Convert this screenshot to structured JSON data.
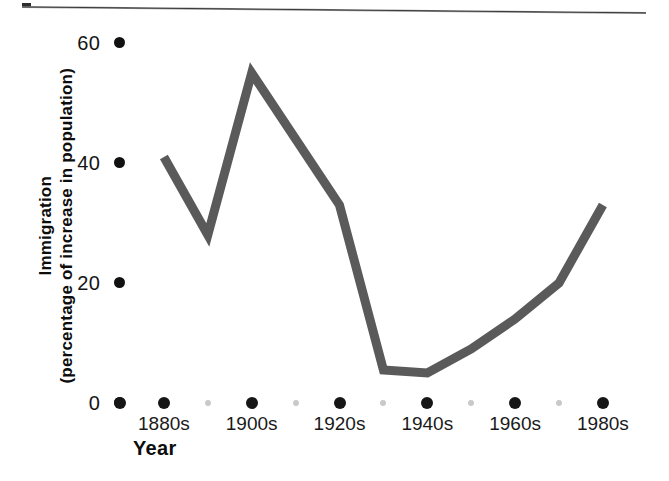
{
  "chart_data": {
    "type": "line",
    "title": "",
    "xlabel": "Year",
    "ylabel_line1": "Immigration",
    "ylabel_line2": "(percentage of increase in population)",
    "ylabel": "Immigration (percentage of increase in population)",
    "xlim": [
      1870,
      1990
    ],
    "ylim": [
      0,
      62
    ],
    "grid": false,
    "legend": "none",
    "line_color": "#5a5a5a",
    "line_width_px": 9,
    "y_ticks": [
      {
        "value": 60,
        "label": "60"
      },
      {
        "value": 40,
        "label": "40"
      },
      {
        "value": 20,
        "label": "20"
      },
      {
        "value": 0,
        "label": "0"
      }
    ],
    "x_ticks": [
      {
        "decade": 1870,
        "label": "",
        "major": true
      },
      {
        "decade": 1880,
        "label": "1880s",
        "major": true
      },
      {
        "decade": 1890,
        "label": "",
        "major": false
      },
      {
        "decade": 1900,
        "label": "1900s",
        "major": true
      },
      {
        "decade": 1910,
        "label": "",
        "major": false
      },
      {
        "decade": 1920,
        "label": "1920s",
        "major": true
      },
      {
        "decade": 1930,
        "label": "",
        "major": false
      },
      {
        "decade": 1940,
        "label": "1940s",
        "major": true
      },
      {
        "decade": 1950,
        "label": "",
        "major": false
      },
      {
        "decade": 1960,
        "label": "1960s",
        "major": true
      },
      {
        "decade": 1970,
        "label": "",
        "major": false
      },
      {
        "decade": 1980,
        "label": "1980s",
        "major": true
      }
    ],
    "categories": [
      "1880s",
      "1890s",
      "1900s",
      "1910s",
      "1920s",
      "1930s",
      "1940s",
      "1950s",
      "1960s",
      "1970s",
      "1980s"
    ],
    "values": [
      41,
      28,
      55,
      44,
      33,
      5.5,
      5,
      9,
      14,
      20,
      33
    ],
    "series": [
      {
        "name": "Immigration",
        "points": [
          {
            "x": 1880,
            "y": 41
          },
          {
            "x": 1890,
            "y": 28
          },
          {
            "x": 1900,
            "y": 55
          },
          {
            "x": 1910,
            "y": 44
          },
          {
            "x": 1920,
            "y": 33
          },
          {
            "x": 1930,
            "y": 5.5
          },
          {
            "x": 1940,
            "y": 5
          },
          {
            "x": 1950,
            "y": 9
          },
          {
            "x": 1960,
            "y": 14
          },
          {
            "x": 1970,
            "y": 20
          },
          {
            "x": 1980,
            "y": 33
          }
        ]
      }
    ]
  },
  "axis": {
    "x_title": "Year",
    "y_title_line1": "Immigration",
    "y_title_line2": "(percentage of increase in population)"
  },
  "colors": {
    "line": "#5a5a5a",
    "tick_major": "#161616",
    "tick_minor": "#c9c9c9",
    "text": "#141414",
    "background": "#ffffff"
  }
}
